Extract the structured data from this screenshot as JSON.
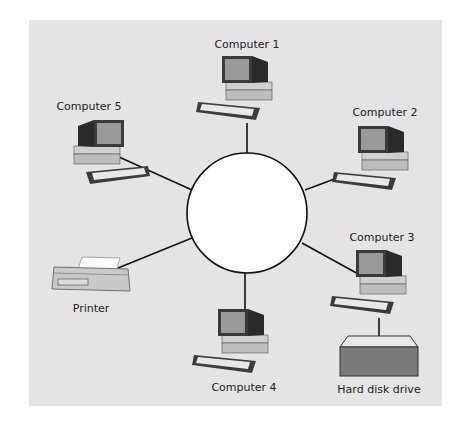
{
  "diagram": {
    "type": "star-network",
    "background": "#e4e4e4",
    "hub": {
      "label": "",
      "cx": 247,
      "cy": 213,
      "r": 60,
      "fill": "#ffffff"
    },
    "nodes": [
      {
        "id": "computer1",
        "label": "Computer 1",
        "kind": "computer",
        "label_x": 247,
        "label_y": 38
      },
      {
        "id": "computer2",
        "label": "Computer 2",
        "kind": "computer",
        "label_x": 385,
        "label_y": 106
      },
      {
        "id": "computer3",
        "label": "Computer 3",
        "kind": "computer",
        "label_x": 382,
        "label_y": 231
      },
      {
        "id": "computer4",
        "label": "Computer 4",
        "kind": "computer",
        "label_x": 244,
        "label_y": 381
      },
      {
        "id": "computer5",
        "label": "Computer 5",
        "kind": "computer",
        "label_x": 89,
        "label_y": 100
      },
      {
        "id": "printer",
        "label": "Printer",
        "kind": "printer",
        "label_x": 91,
        "label_y": 302
      },
      {
        "id": "hdd",
        "label": "Hard disk drive",
        "kind": "storage",
        "label_x": 379,
        "label_y": 383
      }
    ],
    "edges": [
      [
        "hub",
        "computer1"
      ],
      [
        "hub",
        "computer2"
      ],
      [
        "hub",
        "computer3"
      ],
      [
        "hub",
        "computer4"
      ],
      [
        "hub",
        "computer5"
      ],
      [
        "hub",
        "printer"
      ],
      [
        "computer3",
        "hdd"
      ]
    ]
  }
}
